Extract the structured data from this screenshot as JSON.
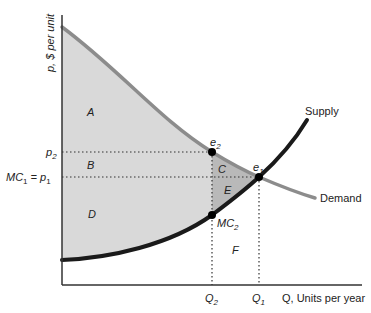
{
  "diagram": {
    "type": "economics-supply-demand-welfare",
    "y_axis_label": "p, $ per unit",
    "x_axis_label": "Q, Units per year",
    "price_labels": {
      "p2": "p",
      "p2_sub": "2",
      "p1_prefix": "MC",
      "p1_prefix_sub": "1",
      "p1_eq": " = p",
      "p1_sub": "1"
    },
    "quantity_labels": {
      "q2": "Q",
      "q2_sub": "2",
      "q1": "Q",
      "q1_sub": "1"
    },
    "curves": {
      "supply": "Supply",
      "demand": "Demand"
    },
    "points": {
      "e1": "e",
      "e1_sub": "1",
      "e2": "e",
      "e2_sub": "2",
      "mc2": "MC",
      "mc2_sub": "2"
    },
    "regions": {
      "A": "A",
      "B": "B",
      "C": "C",
      "D": "D",
      "E": "E",
      "F": "F"
    },
    "colors": {
      "surplus_fill": "#d9d9d9",
      "deadweight_fill": "#b9b9b9",
      "demand_line": "#8c8c8c",
      "supply_line": "#1a1a1a",
      "axis": "#333333"
    }
  }
}
